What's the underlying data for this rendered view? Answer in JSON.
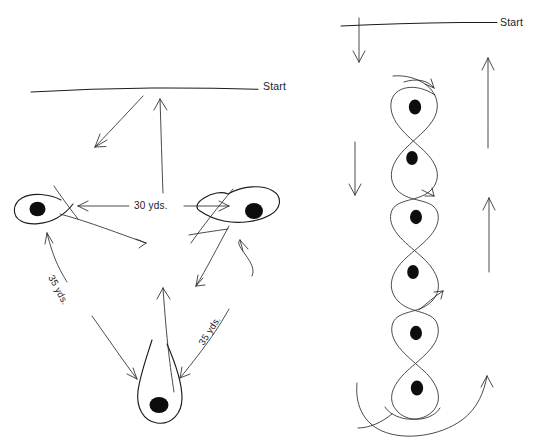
{
  "page": {
    "background_color": "#ffffff",
    "ink_color": "#1c1c1c",
    "width": 535,
    "height": 440
  },
  "diagrams": [
    {
      "id": "triangle-drill",
      "name": "Triangle Cone Drill",
      "start_label": "Start",
      "cones": [
        {
          "id": "cone-left",
          "position": "left",
          "x": 38,
          "y": 210
        },
        {
          "id": "cone-right",
          "position": "right",
          "x": 253,
          "y": 214
        },
        {
          "id": "cone-bottom",
          "position": "bottom",
          "x": 158,
          "y": 405
        }
      ],
      "measurements": [
        {
          "id": "measure-top",
          "label": "30 yds.",
          "between": [
            "cone-left",
            "cone-right"
          ]
        },
        {
          "id": "measure-left-side",
          "label": "35 yds.",
          "between": [
            "cone-left",
            "cone-bottom"
          ]
        },
        {
          "id": "measure-right-side",
          "label": "35 yds.",
          "between": [
            "cone-right",
            "cone-bottom"
          ]
        }
      ]
    },
    {
      "id": "serpentine-drill",
      "name": "Serpentine Figure-Eight Weave Drill",
      "start_label": "Start",
      "cones": [
        {
          "id": "weave-cone-1",
          "x": 415,
          "y": 107
        },
        {
          "id": "weave-cone-2",
          "x": 412,
          "y": 158
        },
        {
          "id": "weave-cone-3",
          "x": 416,
          "y": 217
        },
        {
          "id": "weave-cone-4",
          "x": 413,
          "y": 272
        },
        {
          "id": "weave-cone-5",
          "x": 416,
          "y": 333
        },
        {
          "id": "weave-cone-6",
          "x": 417,
          "y": 388
        }
      ],
      "direction_arrows": [
        {
          "id": "arrow-down-upper",
          "direction": "down",
          "side": "left"
        },
        {
          "id": "arrow-down-lower",
          "direction": "down",
          "side": "left"
        },
        {
          "id": "arrow-up-upper",
          "direction": "up",
          "side": "right"
        },
        {
          "id": "arrow-up-lower",
          "direction": "up",
          "side": "right"
        }
      ]
    }
  ]
}
